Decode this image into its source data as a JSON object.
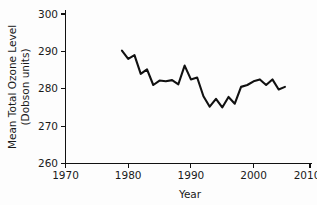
{
  "chart_data": {
    "type": "line",
    "title": "",
    "xlabel": "Year",
    "ylabel": "Mean Total Ozone Level\n(Dobson units)",
    "ylabel_line1": "Mean Total Ozone Level",
    "ylabel_line2": "(Dobson units)",
    "xlim": [
      1970,
      2010
    ],
    "ylim": [
      260,
      300
    ],
    "xticks": [
      1970,
      1980,
      1990,
      2000,
      2010
    ],
    "xtick_labels": [
      "1970",
      "1980",
      "1990",
      "2000",
      "2010"
    ],
    "yticks": [
      260,
      270,
      280,
      290,
      300
    ],
    "ytick_labels": [
      "260",
      "270",
      "280",
      "290",
      "300"
    ],
    "grid": false,
    "legend": false,
    "legend_position": "none",
    "line_color": "#111111",
    "background_color": "#fdfdfd",
    "x": [
      1979,
      1980,
      1981,
      1982,
      1983,
      1984,
      1985,
      1986,
      1987,
      1988,
      1989,
      1990,
      1991,
      1992,
      1993,
      1994,
      1995,
      1996,
      1997,
      1998,
      1999,
      2000,
      2001,
      2002,
      2003,
      2004,
      2005
    ],
    "values": [
      290.2,
      288.0,
      289.0,
      284.0,
      285.2,
      281.0,
      282.2,
      282.0,
      282.3,
      281.2,
      286.2,
      282.5,
      283.0,
      278.0,
      275.2,
      277.3,
      275.0,
      277.8,
      276.0,
      280.5,
      281.0,
      282.0,
      282.5,
      281.0,
      282.5,
      279.8,
      280.5
    ],
    "series": [
      {
        "name": "Mean Total Ozone Level",
        "values": [
          290.2,
          288.0,
          289.0,
          284.0,
          285.2,
          281.0,
          282.2,
          282.0,
          282.3,
          281.2,
          286.2,
          282.5,
          283.0,
          278.0,
          275.2,
          277.3,
          275.0,
          277.8,
          276.0,
          280.5,
          281.0,
          282.0,
          282.5,
          281.0,
          282.5,
          279.8,
          280.5
        ]
      }
    ]
  }
}
